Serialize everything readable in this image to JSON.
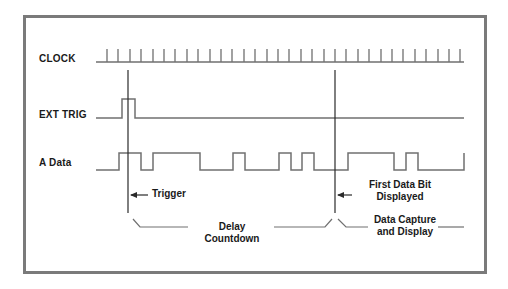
{
  "signals": [
    {
      "id": "clock",
      "label": "CLOCK"
    },
    {
      "id": "ext_trig",
      "label": "EXT TRIG"
    },
    {
      "id": "a_data",
      "label": "A Data"
    }
  ],
  "annotations": {
    "trigger": "Trigger",
    "first_data_bit_line1": "First Data Bit",
    "first_data_bit_line2": "Displayed",
    "delay_countdown": "Delay Countdown",
    "data_capture_line1": "Data Capture",
    "data_capture_line2": "and Display"
  },
  "waveforms": {
    "clock": {
      "x_start": 96,
      "x_end": 464,
      "baseline_y": 62,
      "tick_top_y": 49,
      "tick_count": 32,
      "first_tick_x": 107,
      "tick_spacing": 11.4
    },
    "ext_trig": {
      "low_y": 118,
      "high_y": 99,
      "pulse_rise_x": 122,
      "pulse_fall_x": 135,
      "x_start": 96,
      "x_end": 464
    },
    "a_data": {
      "low_y": 170,
      "high_y": 153,
      "transitions_x": [
        119,
        141,
        153,
        200,
        233,
        245,
        279,
        291,
        302,
        314,
        348,
        394,
        406,
        418,
        464
      ]
    }
  },
  "markers": {
    "trigger_line_x": 128,
    "first_bit_line_x": 335,
    "line_top_y": 70,
    "line_bottom_y": 213
  },
  "colors": {
    "frame": "#7a7a7a",
    "waveform": "#707070",
    "marker_line": "#2a2a2a",
    "text": "#1a1a1a"
  }
}
